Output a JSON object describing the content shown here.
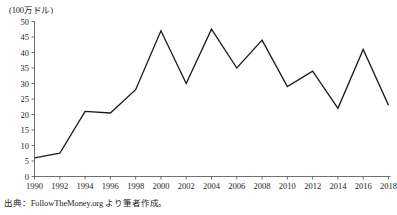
{
  "chart_data": {
    "type": "line",
    "title": "",
    "subtitle": "",
    "xlabel": "",
    "ylabel": "(100万ドル)",
    "unit_label": "(100万ドル)",
    "x": [
      1990,
      1992,
      1994,
      1996,
      1998,
      2000,
      2002,
      2004,
      2006,
      2008,
      2010,
      2012,
      2014,
      2016,
      2018
    ],
    "values": [
      6,
      7.5,
      21,
      20.5,
      28,
      47,
      30,
      47.5,
      35,
      44,
      29,
      34,
      22,
      41,
      23
    ],
    "series": [
      {
        "name": "",
        "values": [
          6,
          7.5,
          21,
          20.5,
          28,
          47,
          30,
          47.5,
          35,
          44,
          29,
          34,
          22,
          41,
          23
        ]
      }
    ],
    "xlim": [
      1990,
      2018
    ],
    "ylim": [
      0,
      50
    ],
    "ytick_labels": [
      "0",
      "5",
      "10",
      "15",
      "20",
      "25",
      "30",
      "35",
      "40",
      "45",
      "50"
    ],
    "ytick_values": [
      0,
      5,
      10,
      15,
      20,
      25,
      30,
      35,
      40,
      45,
      50
    ],
    "xtick_labels": [
      "1990",
      "1992",
      "1994",
      "1996",
      "1998",
      "2000",
      "2002",
      "2004",
      "2006",
      "2008",
      "2010",
      "2012",
      "2014",
      "2016",
      "2018"
    ],
    "xtick_values": [
      1990,
      1992,
      1994,
      1996,
      1998,
      2000,
      2002,
      2004,
      2006,
      2008,
      2010,
      2012,
      2014,
      2016,
      2018
    ],
    "grid": false,
    "legend": false,
    "legend_position": "none",
    "line_color": "#1c1c1c",
    "axis_color": "#4d4d4d",
    "background_color": "#ffffff"
  },
  "figure": {
    "source_note": "出典：FollowTheMoney.org より筆者作成。"
  }
}
